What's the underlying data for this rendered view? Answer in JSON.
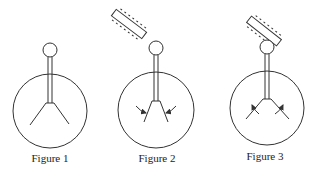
{
  "colors": {
    "stroke": "#333333",
    "background": "#ffffff",
    "caption": "#222222"
  },
  "figures": [
    {
      "id": "figure-1",
      "label": "Figure 1",
      "leaves_state": "diverged",
      "charged_rod": "absent",
      "arrows": "none"
    },
    {
      "id": "figure-2",
      "label": "Figure 2",
      "leaves_state": "converging",
      "charged_rod": "near knob, not touching",
      "arrows": "inward"
    },
    {
      "id": "figure-3",
      "label": "Figure 3",
      "leaves_state": "diverging",
      "charged_rod": "touching knob",
      "arrows": "outward"
    }
  ]
}
